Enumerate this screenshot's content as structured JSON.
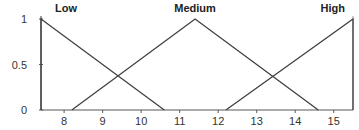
{
  "chart_data": {
    "type": "line",
    "title": "",
    "xlabel": "",
    "ylabel": "",
    "xlim": [
      7.4,
      15.5
    ],
    "ylim": [
      0,
      1
    ],
    "grid": false,
    "legend_position": "inline-top-labels",
    "x_ticks": [
      8,
      9,
      10,
      11,
      12,
      13,
      14,
      15
    ],
    "y_ticks": [
      0,
      0.5,
      1
    ],
    "y_tick_labels": [
      "0",
      "0.5",
      "1"
    ],
    "series": [
      {
        "name": "Low",
        "x": [
          7.4,
          7.4,
          10.6
        ],
        "y": [
          0,
          1,
          0
        ]
      },
      {
        "name": "Medium",
        "x": [
          8.2,
          11.4,
          14.6
        ],
        "y": [
          0,
          1,
          0
        ]
      },
      {
        "name": "High",
        "x": [
          12.2,
          15.5,
          15.5
        ],
        "y": [
          0,
          1,
          0
        ]
      }
    ],
    "line_color": "#404040",
    "axis_color": "#595959"
  }
}
